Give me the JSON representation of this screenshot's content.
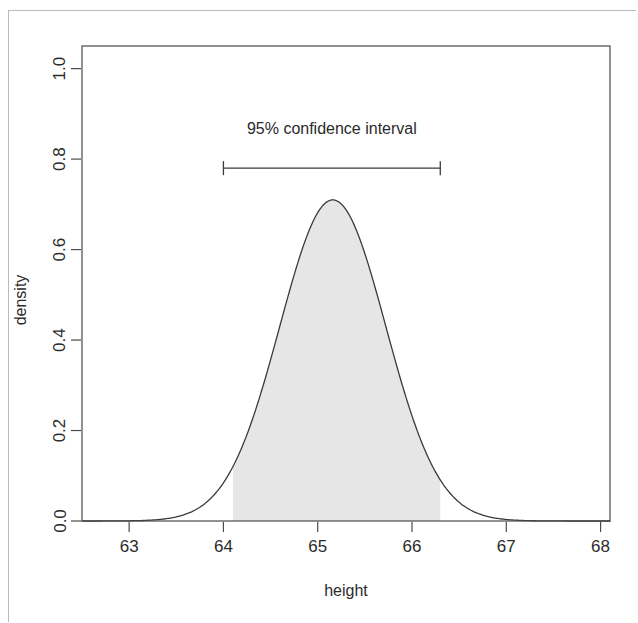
{
  "figure": {
    "background_color": "#ffffff",
    "frame_color": "#4a4a4a",
    "curve_color": "#3a3a3a",
    "fill_color": "#e6e6e6",
    "text_color": "#2b2b2b"
  },
  "chart_data": {
    "type": "line",
    "title": "",
    "xlabel": "height",
    "ylabel": "density",
    "xlim": [
      62.5,
      68.1
    ],
    "ylim": [
      0.0,
      1.05
    ],
    "grid": false,
    "legend": null,
    "x_ticks": [
      63,
      64,
      65,
      66,
      67,
      68
    ],
    "x_tick_labels": [
      "63",
      "64",
      "65",
      "66",
      "67",
      "68"
    ],
    "y_ticks": [
      0.0,
      0.2,
      0.4,
      0.6,
      0.8,
      1.0
    ],
    "y_tick_labels": [
      "0.0",
      "0.2",
      "0.4",
      "0.6",
      "0.8",
      "1.0"
    ],
    "series": [
      {
        "name": "normal density",
        "distribution": "normal",
        "mean": 65.16,
        "sd": 0.562,
        "peak_density": 0.71,
        "x": [
          62.5,
          62.7,
          62.9,
          63.1,
          63.3,
          63.5,
          63.7,
          63.9,
          64.1,
          64.3,
          64.5,
          64.7,
          64.9,
          65.16,
          65.4,
          65.6,
          65.8,
          66.0,
          66.3,
          66.5,
          66.7,
          66.9,
          67.1,
          67.3,
          67.5,
          67.7,
          67.9,
          68.1
        ],
        "y": [
          0.0,
          0.0,
          0.001,
          0.003,
          0.008,
          0.022,
          0.052,
          0.108,
          0.195,
          0.312,
          0.446,
          0.575,
          0.67,
          0.71,
          0.678,
          0.607,
          0.497,
          0.375,
          0.195,
          0.108,
          0.052,
          0.022,
          0.008,
          0.003,
          0.001,
          0.0,
          0.0,
          0.0
        ]
      }
    ],
    "shaded_region": {
      "label": "confidence region",
      "x_start": 64.1,
      "x_end": 66.3,
      "fill": "#e6e6e6"
    },
    "annotations": [
      {
        "name": "confidence-interval",
        "text": "95% confidence interval",
        "x_start": 64.0,
        "x_end": 66.3,
        "y": 0.78,
        "label_y": 0.855,
        "style": "error-bar-with-caps"
      }
    ]
  },
  "axes": {
    "x_title": "height",
    "y_title": "density"
  },
  "annotation": {
    "ci_text": "95% confidence interval"
  }
}
